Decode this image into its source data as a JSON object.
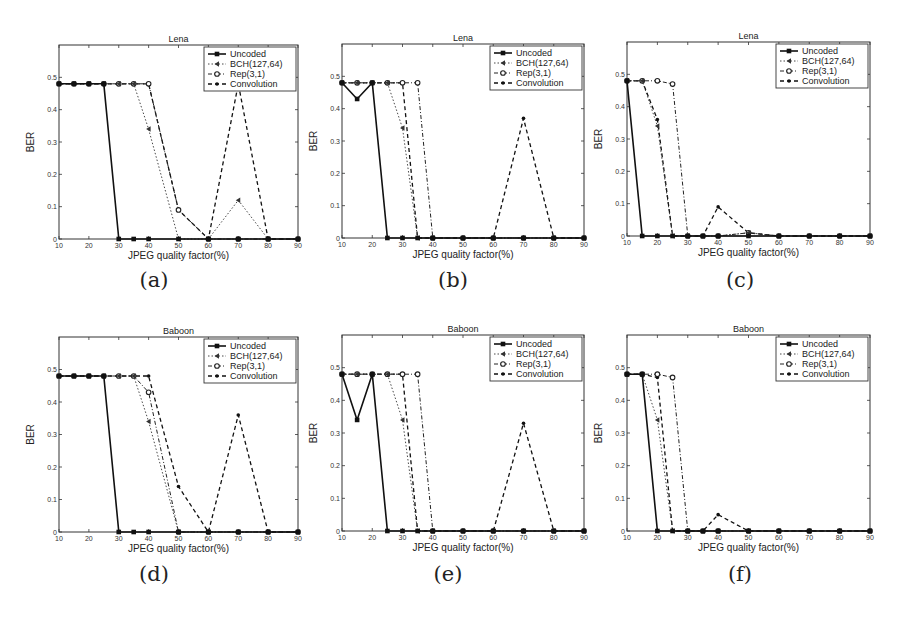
{
  "figure": {
    "x_ticks": [
      10,
      20,
      30,
      40,
      50,
      60,
      70,
      80,
      90
    ],
    "y_ticks": [
      0,
      0.1,
      0.2,
      0.3,
      0.4,
      0.5
    ],
    "y_tick_labels": [
      "0",
      "0.1",
      "0.2",
      "0.3",
      "0.4",
      "0.5"
    ],
    "xlabel": "JPEG quality factor(%)",
    "ylabel": "BER",
    "legend": [
      "Uncoded",
      "BCH(127,64)",
      "Rep(3,1)",
      "Convolution"
    ]
  },
  "chart_data": [
    {
      "id": "a",
      "caption": "(a)",
      "type": "line",
      "title": "Lena",
      "xlabel": "JPEG quality factor(%)",
      "ylabel": "BER",
      "xlim": [
        10,
        90
      ],
      "ylim": [
        0,
        0.6
      ],
      "legend_position": "upper right",
      "x": [
        10,
        15,
        20,
        25,
        30,
        35,
        40,
        50,
        60,
        70,
        80,
        90
      ],
      "series": [
        {
          "name": "Uncoded",
          "values": [
            0.48,
            0.48,
            0.48,
            0.48,
            0,
            0,
            0,
            0,
            0,
            0,
            0,
            0
          ]
        },
        {
          "name": "BCH(127,64)",
          "values": [
            0.48,
            0.48,
            0.48,
            0.48,
            0.48,
            0.48,
            0.34,
            0,
            0,
            0.12,
            0,
            0
          ]
        },
        {
          "name": "Rep(3,1)",
          "values": [
            0.48,
            0.48,
            0.48,
            0.48,
            0.48,
            0.48,
            0.48,
            0.09,
            0,
            0,
            0,
            0
          ]
        },
        {
          "name": "Convolution",
          "values": [
            0.48,
            0.48,
            0.48,
            0.48,
            0.48,
            0.48,
            0.48,
            0.09,
            0,
            0.48,
            0,
            0
          ]
        }
      ]
    },
    {
      "id": "b",
      "caption": "(b)",
      "type": "line",
      "title": "Lena",
      "xlabel": "JPEG quality factor(%)",
      "ylabel": "BER",
      "xlim": [
        10,
        90
      ],
      "ylim": [
        0,
        0.6
      ],
      "legend_position": "upper right",
      "x": [
        10,
        15,
        20,
        25,
        30,
        35,
        40,
        50,
        60,
        70,
        80,
        90
      ],
      "series": [
        {
          "name": "Uncoded",
          "values": [
            0.48,
            0.43,
            0.48,
            0,
            0,
            0,
            0,
            0,
            0,
            0,
            0,
            0
          ]
        },
        {
          "name": "BCH(127,64)",
          "values": [
            0.48,
            0.48,
            0.48,
            0.48,
            0.34,
            0,
            0,
            0,
            0,
            0,
            0,
            0
          ]
        },
        {
          "name": "Rep(3,1)",
          "values": [
            0.48,
            0.48,
            0.48,
            0.48,
            0.48,
            0.48,
            0,
            0,
            0,
            0,
            0,
            0
          ]
        },
        {
          "name": "Convolution",
          "values": [
            0.48,
            0.48,
            0.48,
            0.48,
            0.48,
            0,
            0,
            0,
            0,
            0.37,
            0,
            0
          ]
        }
      ]
    },
    {
      "id": "c",
      "caption": "(c)",
      "type": "line",
      "title": "Lena",
      "xlabel": "JPEG quality factor(%)",
      "ylabel": "BER",
      "xlim": [
        10,
        90
      ],
      "ylim": [
        0,
        0.6
      ],
      "legend_position": "upper right",
      "x": [
        10,
        15,
        20,
        25,
        30,
        35,
        40,
        50,
        60,
        70,
        80,
        90
      ],
      "series": [
        {
          "name": "Uncoded",
          "values": [
            0.48,
            0,
            0,
            0,
            0,
            0,
            0,
            0,
            0,
            0,
            0,
            0
          ]
        },
        {
          "name": "BCH(127,64)",
          "values": [
            0.48,
            0.48,
            0.34,
            0,
            0,
            0,
            0,
            0.01,
            0,
            0,
            0,
            0
          ]
        },
        {
          "name": "Rep(3,1)",
          "values": [
            0.48,
            0.48,
            0.48,
            0.47,
            0,
            0,
            0,
            0.01,
            0,
            0,
            0,
            0
          ]
        },
        {
          "name": "Convolution",
          "values": [
            0.48,
            0.48,
            0.36,
            0,
            0,
            0,
            0.09,
            0.01,
            0,
            0,
            0,
            0
          ]
        }
      ]
    },
    {
      "id": "d",
      "caption": "(d)",
      "type": "line",
      "title": "Baboon",
      "xlabel": "JPEG quality factor(%)",
      "ylabel": "BER",
      "xlim": [
        10,
        90
      ],
      "ylim": [
        0,
        0.6
      ],
      "legend_position": "upper right",
      "x": [
        10,
        15,
        20,
        25,
        30,
        35,
        40,
        50,
        60,
        70,
        80,
        90
      ],
      "series": [
        {
          "name": "Uncoded",
          "values": [
            0.48,
            0.48,
            0.48,
            0.48,
            0,
            0,
            0,
            0,
            0,
            0,
            0,
            0
          ]
        },
        {
          "name": "BCH(127,64)",
          "values": [
            0.48,
            0.48,
            0.48,
            0.48,
            0.48,
            0.48,
            0.34,
            0,
            0,
            0,
            0,
            0
          ]
        },
        {
          "name": "Rep(3,1)",
          "values": [
            0.48,
            0.48,
            0.48,
            0.48,
            0.48,
            0.48,
            0.43,
            0,
            0,
            0,
            0,
            0
          ]
        },
        {
          "name": "Convolution",
          "values": [
            0.48,
            0.48,
            0.48,
            0.48,
            0.48,
            0.48,
            0.48,
            0.14,
            0,
            0.36,
            0,
            0
          ]
        }
      ]
    },
    {
      "id": "e",
      "caption": "(e)",
      "type": "line",
      "title": "Baboon",
      "xlabel": "JPEG quality factor(%)",
      "ylabel": "BER",
      "xlim": [
        10,
        90
      ],
      "ylim": [
        0,
        0.6
      ],
      "legend_position": "upper right",
      "x": [
        10,
        15,
        20,
        25,
        30,
        35,
        40,
        50,
        60,
        70,
        80,
        90
      ],
      "series": [
        {
          "name": "Uncoded",
          "values": [
            0.48,
            0.34,
            0.48,
            0,
            0,
            0,
            0,
            0,
            0,
            0,
            0,
            0
          ]
        },
        {
          "name": "BCH(127,64)",
          "values": [
            0.48,
            0.48,
            0.48,
            0.48,
            0.34,
            0,
            0,
            0,
            0,
            0,
            0,
            0
          ]
        },
        {
          "name": "Rep(3,1)",
          "values": [
            0.48,
            0.48,
            0.48,
            0.48,
            0.48,
            0.48,
            0,
            0,
            0,
            0,
            0,
            0
          ]
        },
        {
          "name": "Convolution",
          "values": [
            0.48,
            0.48,
            0.48,
            0.48,
            0.48,
            0,
            0,
            0,
            0,
            0.33,
            0,
            0
          ]
        }
      ]
    },
    {
      "id": "f",
      "caption": "(f)",
      "type": "line",
      "title": "Baboon",
      "xlabel": "JPEG quality factor(%)",
      "ylabel": "BER",
      "xlim": [
        10,
        90
      ],
      "ylim": [
        0,
        0.6
      ],
      "legend_position": "upper right",
      "x": [
        10,
        15,
        20,
        25,
        30,
        35,
        40,
        50,
        60,
        70,
        80,
        90
      ],
      "series": [
        {
          "name": "Uncoded",
          "values": [
            0.48,
            0.48,
            0,
            0,
            0,
            0,
            0,
            0,
            0,
            0,
            0,
            0
          ]
        },
        {
          "name": "BCH(127,64)",
          "values": [
            0.48,
            0.48,
            0.34,
            0,
            0,
            0,
            0,
            0,
            0,
            0,
            0,
            0
          ]
        },
        {
          "name": "Rep(3,1)",
          "values": [
            0.48,
            0.48,
            0.48,
            0.47,
            0,
            0,
            0,
            0,
            0,
            0,
            0,
            0
          ]
        },
        {
          "name": "Convolution",
          "values": [
            0.48,
            0.48,
            0.47,
            0,
            0,
            0,
            0.05,
            0,
            0,
            0,
            0,
            0
          ]
        }
      ]
    }
  ]
}
